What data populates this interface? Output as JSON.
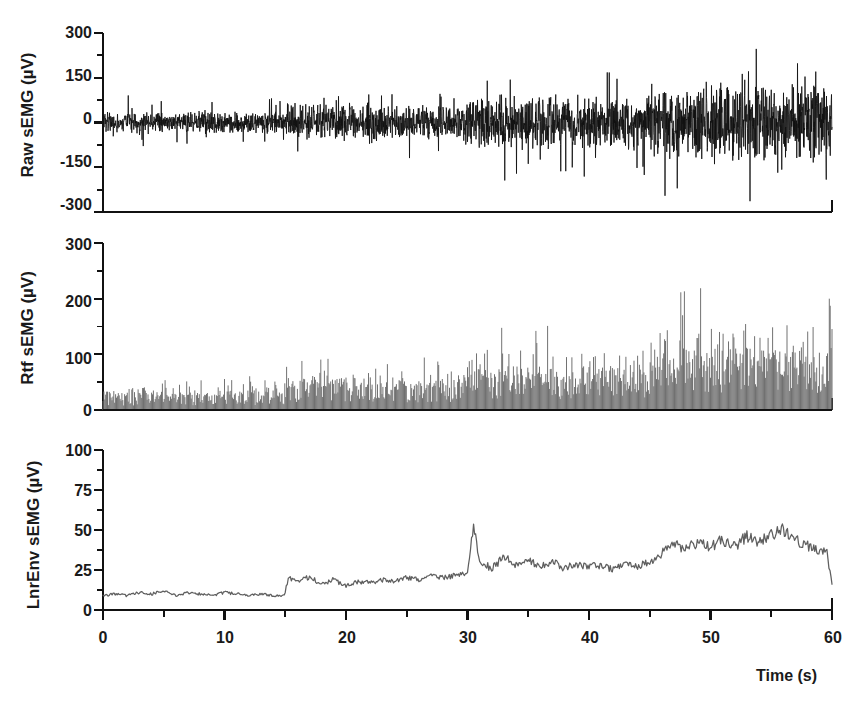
{
  "figure": {
    "title": "",
    "background": "#ffffff",
    "xaxis_title": "Time (s)"
  },
  "panels": [
    {
      "id": "raw",
      "ylabel": "Raw sEMG  (µV)",
      "ytick_labels": [
        "300",
        "150",
        "0",
        "-150",
        "-300"
      ],
      "color": "#111111"
    },
    {
      "id": "rectified",
      "ylabel": "Rtf sEMG  (µV)",
      "ytick_labels": [
        "300",
        "200",
        "100",
        "0"
      ],
      "color": "#6a6a6a"
    },
    {
      "id": "envelope",
      "ylabel": "LnrEnv sEMG  (µV)",
      "ytick_labels": [
        "100",
        "75",
        "50",
        "25",
        "0"
      ],
      "color": "#5f5f5f"
    }
  ],
  "xtick_labels": [
    "0",
    "10",
    "20",
    "30",
    "40",
    "50",
    "60"
  ],
  "chart_data": {
    "type": "line",
    "title": "",
    "xlabel": "Time (s)",
    "xlim": [
      0,
      60
    ],
    "xticks": [
      0,
      10,
      20,
      30,
      40,
      50,
      60
    ],
    "xminorticks": [
      5,
      15,
      25,
      35,
      45,
      55
    ],
    "grid": false,
    "legend": null,
    "sampling_note": "Signal recreated procedurally from envelope amplitude profile read off the figure.",
    "phases": [
      {
        "t_start": 0,
        "t_end": 15,
        "raw_peak_uV": 50,
        "rtf_mean_uV": 22,
        "rtf_peak_uV": 60,
        "env_uV": 10
      },
      {
        "t_start": 15,
        "t_end": 30,
        "raw_peak_uV": 85,
        "rtf_mean_uV": 38,
        "rtf_peak_uV": 105,
        "env_uV": 19
      },
      {
        "t_start": 30,
        "t_end": 45,
        "raw_peak_uV": 120,
        "rtf_mean_uV": 52,
        "rtf_peak_uV": 160,
        "env_uV": 26
      },
      {
        "t_start": 45,
        "t_end": 60,
        "raw_peak_uV": 165,
        "rtf_mean_uV": 78,
        "rtf_peak_uV": 225,
        "env_uV": 40
      }
    ],
    "subplots": [
      {
        "id": "raw",
        "name": "Raw sEMG",
        "type": "line",
        "ylabel": "Raw sEMG  (µV)",
        "ylim": [
          -300,
          300
        ],
        "yticks": [
          -300,
          -150,
          0,
          150,
          300
        ],
        "yminorticks": [
          -225,
          -75,
          75,
          225
        ],
        "color": "#111111",
        "description": "Bipolar raw surface EMG oscillating about 0 µV; burst amplitude grows in four steps across the 60 s trial.",
        "envelope_t": [
          0,
          5,
          10,
          14.8,
          15.2,
          20,
          25,
          29.8,
          30.2,
          35,
          40,
          44.8,
          45.2,
          50,
          55,
          60
        ],
        "envelope_peak_uV": [
          48,
          46,
          50,
          47,
          82,
          86,
          80,
          84,
          118,
          122,
          116,
          120,
          160,
          168,
          172,
          165
        ]
      },
      {
        "id": "rectified",
        "name": "Rtf sEMG",
        "type": "area",
        "ylabel": "Rtf sEMG  (µV)",
        "ylim": [
          0,
          300
        ],
        "yticks": [
          0,
          100,
          200,
          300
        ],
        "yminorticks": [
          50,
          150,
          250
        ],
        "color": "#6a6a6a",
        "description": "Full-wave rectified sEMG drawn as dense vertical gray fill; mean level and peak spikes rise in four steps.",
        "mean_t": [
          0,
          5,
          10,
          14.8,
          15.2,
          20,
          25,
          29.8,
          30.2,
          35,
          40,
          44.8,
          45.2,
          50,
          55,
          60
        ],
        "mean_uV": [
          24,
          22,
          25,
          23,
          40,
          42,
          38,
          40,
          55,
          58,
          54,
          56,
          78,
          82,
          84,
          80
        ],
        "peak_uV": [
          58,
          55,
          62,
          56,
          100,
          108,
          98,
          104,
          158,
          150,
          145,
          150,
          205,
          215,
          222,
          210
        ]
      },
      {
        "id": "envelope",
        "name": "LnrEnv sEMG",
        "type": "line",
        "ylabel": "LnrEnv sEMG  (µV)",
        "ylim": [
          0,
          100
        ],
        "yticks": [
          0,
          25,
          50,
          75,
          100
        ],
        "yminorticks": [
          12.5,
          37.5,
          62.5,
          87.5
        ],
        "color": "#5f5f5f",
        "description": "Low-pass linear envelope; flat ~10 µV baseline to 15 s, steps to ~19 µV, transient spike to ~54 µV at 30.5 s, then rises to ~40 µV after 45 s and drops sharply at the end.",
        "t": [
          0,
          1,
          2,
          3,
          4,
          5,
          6,
          7,
          8,
          9,
          10,
          11,
          12,
          13,
          14,
          14.9,
          15.3,
          16,
          17,
          18,
          19,
          20,
          21,
          22,
          23,
          24,
          25,
          26,
          27,
          28,
          29,
          30.0,
          30.5,
          31,
          32,
          33,
          34,
          35,
          36,
          37,
          38,
          39,
          40,
          41,
          42,
          43,
          44,
          45,
          46,
          47,
          48,
          49,
          50,
          51,
          52,
          53,
          54,
          55,
          56,
          57,
          58,
          59,
          59.6,
          60
        ],
        "y_uV": [
          9,
          10,
          9,
          11,
          10,
          12,
          9,
          11,
          10,
          9,
          11,
          10,
          9,
          10,
          9,
          9,
          20,
          17,
          21,
          16,
          19,
          15,
          18,
          17,
          19,
          18,
          20,
          19,
          21,
          20,
          22,
          24,
          54,
          30,
          26,
          33,
          28,
          31,
          27,
          30,
          26,
          29,
          27,
          28,
          25,
          29,
          27,
          30,
          36,
          41,
          38,
          43,
          39,
          44,
          40,
          46,
          42,
          47,
          50,
          44,
          40,
          37,
          35,
          16
        ]
      }
    ]
  }
}
